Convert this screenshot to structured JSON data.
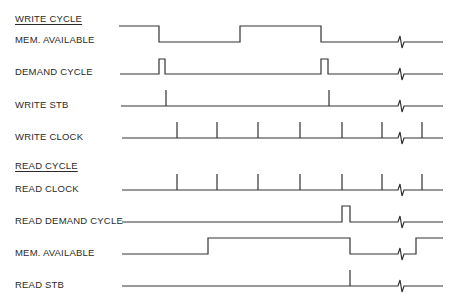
{
  "write_section": {
    "title": "WRITE CYCLE",
    "signals": [
      {
        "label": "MEM. AVAILABLE"
      },
      {
        "label": "DEMAND CYCLE"
      },
      {
        "label": "WRITE STB"
      },
      {
        "label": "WRITE CLOCK"
      }
    ]
  },
  "read_section": {
    "title": "READ CYCLE",
    "signals": [
      {
        "label": "READ CLOCK"
      },
      {
        "label": "READ DEMAND CYCLE"
      },
      {
        "label": "MEM. AVAILABLE"
      },
      {
        "label": "READ STB"
      }
    ]
  },
  "timing": {
    "clock_tick_x": [
      177,
      217,
      258,
      300,
      342,
      382,
      422
    ],
    "break_x": 402,
    "line_end_x": 443
  }
}
